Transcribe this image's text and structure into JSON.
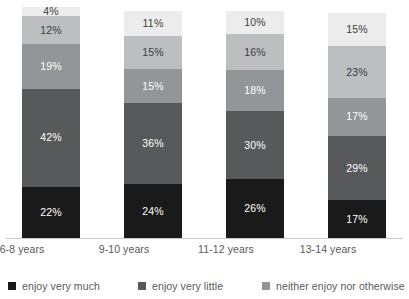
{
  "chart_data": {
    "type": "bar",
    "subtype": "stacked-bar-100-percent",
    "orientation": "vertical",
    "title": "",
    "subtitle": "",
    "xlabel": "",
    "ylabel": "",
    "ylim": [
      0,
      100
    ],
    "grid": false,
    "value_suffix": "%",
    "legend_position": "bottom-left",
    "categories": [
      "6-8 years",
      "9-10 years",
      "11-12 years",
      "13-14 years"
    ],
    "series": [
      {
        "name": "enjoy very much",
        "color": "#1a1a1a",
        "label_color": "#ffffff",
        "in_legend": true,
        "values": [
          22,
          24,
          26,
          17
        ],
        "labels": [
          "22%",
          "24%",
          "26%",
          "17%"
        ]
      },
      {
        "name": "enjoy very little",
        "color": "#58595b",
        "label_color": "#ffffff",
        "in_legend": true,
        "values": [
          42,
          36,
          30,
          29
        ],
        "labels": [
          "42%",
          "36%",
          "30%",
          "29%"
        ]
      },
      {
        "name": "neither enjoy nor otherwise",
        "color": "#939598",
        "label_color": "#ffffff",
        "in_legend": true,
        "values": [
          19,
          15,
          18,
          17
        ],
        "labels": [
          "19%",
          "15%",
          "18%",
          "17%"
        ]
      },
      {
        "name": "series-4",
        "color": "#bcbec0",
        "label_color": "#3c3c3c",
        "in_legend": false,
        "values": [
          12,
          15,
          16,
          23
        ],
        "labels": [
          "12%",
          "15%",
          "16%",
          "23%"
        ]
      },
      {
        "name": "series-5",
        "color": "#ececec",
        "label_color": "#3c3c3c",
        "in_legend": false,
        "values": [
          4,
          11,
          10,
          15
        ],
        "labels": [
          "4%",
          "11%",
          "10%",
          "15%"
        ]
      }
    ]
  },
  "axis": {
    "category_labels": [
      {
        "text": "6-8 years"
      },
      {
        "text": "9-10 years"
      },
      {
        "text": "11-12 years"
      },
      {
        "text": "13-14 years"
      }
    ]
  },
  "legend": {
    "items": [
      {
        "label": "enjoy very much",
        "color": "#1a1a1a"
      },
      {
        "label": "enjoy very little",
        "color": "#58595b"
      },
      {
        "label": "neither enjoy nor otherwise",
        "color": "#939598"
      }
    ]
  },
  "layout": {
    "bar_x_positions": [
      22,
      124,
      226,
      328
    ],
    "bar_total_heights": [
      231,
      227,
      227,
      225
    ],
    "label_x_positions": [
      -23,
      79,
      181,
      283
    ],
    "legend_x_positions": [
      8,
      138,
      262
    ]
  }
}
